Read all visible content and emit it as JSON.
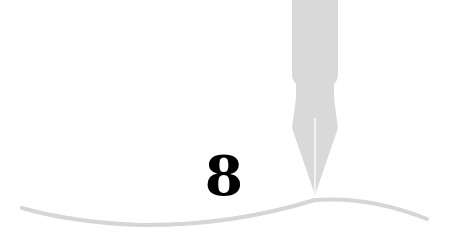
{
  "illustration": {
    "chapter_number": "8",
    "icons": [
      "fountain-pen-icon",
      "wave-line"
    ],
    "colors": {
      "pen": "#d9d9d9",
      "wave": "#d6d6d6",
      "number": "#000000",
      "background": "#ffffff"
    }
  }
}
